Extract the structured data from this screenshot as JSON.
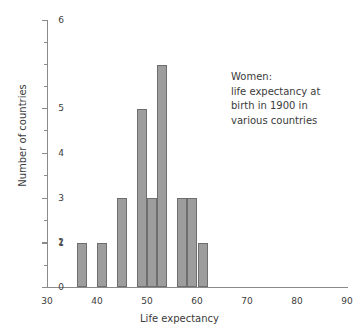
{
  "chart_data": {
    "type": "bar",
    "title": "",
    "xlabel": "Life expectancy",
    "ylabel": "Number of countries",
    "xlim": [
      30,
      90
    ],
    "ylim": [
      0,
      6
    ],
    "xticks": [
      30,
      40,
      50,
      60,
      70,
      80,
      90
    ],
    "yticks": [
      0,
      1,
      2,
      3,
      4,
      5,
      6
    ],
    "y_minor_ticks": [
      0.5,
      1.5,
      2.5,
      3.5,
      4.5,
      5.5
    ],
    "grid": false,
    "legend": false,
    "bin_width": 2,
    "bins": [
      {
        "start": 36,
        "end": 38,
        "value": 1
      },
      {
        "start": 40,
        "end": 42,
        "value": 1
      },
      {
        "start": 44,
        "end": 46,
        "value": 2
      },
      {
        "start": 48,
        "end": 50,
        "value": 4
      },
      {
        "start": 50,
        "end": 52,
        "value": 2
      },
      {
        "start": 52,
        "end": 54,
        "value": 5
      },
      {
        "start": 56,
        "end": 58,
        "value": 2
      },
      {
        "start": 58,
        "end": 60,
        "value": 2
      },
      {
        "start": 60,
        "end": 62,
        "value": 1
      }
    ],
    "categories": [
      "36-38",
      "40-42",
      "44-46",
      "48-50",
      "50-52",
      "52-54",
      "56-58",
      "58-60",
      "60-62"
    ],
    "values": [
      1,
      1,
      2,
      4,
      2,
      5,
      2,
      2,
      1
    ],
    "bar_color": "#9d9d9d",
    "bar_edge_color": "#6e6e6e",
    "axis_color": "#8a8a8a",
    "text_color": "#3b3b3b",
    "annotation": {
      "lines": [
        "Women:",
        "life expectancy at",
        "birth in 1900 in",
        "various countries"
      ]
    }
  }
}
